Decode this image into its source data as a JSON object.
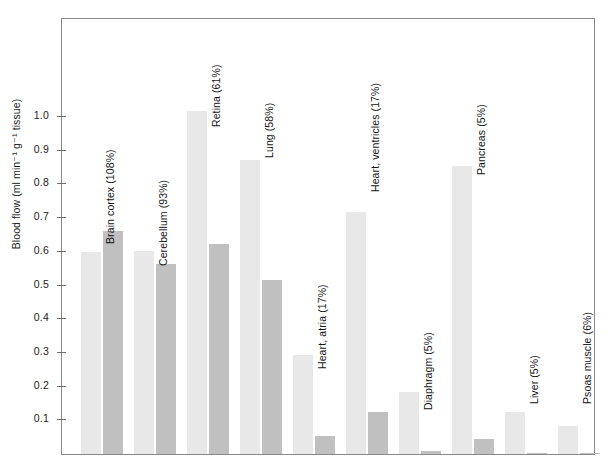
{
  "chart_data": {
    "type": "bar",
    "title": "",
    "xlabel": "",
    "ylabel": "Blood flow (ml min⁻¹ g⁻¹ tissue)",
    "ylim": [
      0,
      1.12
    ],
    "yticks": [
      0.1,
      0.2,
      0.3,
      0.4,
      0.5,
      0.6,
      0.7,
      0.8,
      0.9,
      1.0
    ],
    "ytick_labels": [
      "0.1",
      "0.2",
      "0.3",
      "0.4",
      "0.5",
      "0.6",
      "0.7",
      "0.8",
      "0.9",
      "1.0"
    ],
    "grid": false,
    "legend": "none",
    "categories": [
      "Brain cortex (108%)",
      "Cerebellum (93%)",
      "Retina (61%)",
      "Lung (58%)",
      "Heart, atria (17%)",
      "Heart, ventricles (17%)",
      "Diaphragm (5%)",
      "Pancreas (5%)",
      "Liver (5%)",
      "Psoas muscle (6%)"
    ],
    "series": [
      {
        "name": "series-1",
        "color": "#e8e8e8",
        "values": [
          0.605,
          0.608,
          1.025,
          0.878,
          0.3,
          0.725,
          0.19,
          0.86,
          0.13,
          0.09
        ]
      },
      {
        "name": "series-2",
        "color": "#c0c0c0",
        "values": [
          0.668,
          0.57,
          0.63,
          0.523,
          0.06,
          0.13,
          0.015,
          0.05,
          0.01,
          0.01
        ]
      }
    ]
  },
  "colors": {
    "series_1": "#e8e8e8",
    "series_2": "#c0c0c0",
    "axis": "#8a8a86",
    "text": "#141414",
    "background": "#ffffff"
  }
}
